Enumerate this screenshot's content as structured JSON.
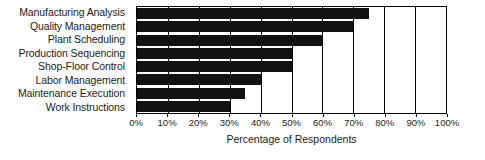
{
  "chart_data": {
    "type": "bar",
    "orientation": "horizontal",
    "title": "",
    "xlabel": "Percentage of Respondents",
    "ylabel": "",
    "categories": [
      "Manufacturing Analysis",
      "Quality Management",
      "Plant Scheduling",
      "Production Sequencing",
      "Shop-Floor Control",
      "Labor Management",
      "Maintenance Execution",
      "Work Instructions"
    ],
    "values": [
      75,
      70,
      60,
      50,
      50,
      40,
      35,
      30
    ],
    "xlim": [
      0,
      100
    ],
    "tick_values": [
      0,
      10,
      20,
      30,
      40,
      50,
      60,
      70,
      80,
      90,
      100
    ],
    "tick_labels": [
      "0%",
      "10%",
      "20%",
      "30%",
      "40%",
      "50%",
      "60%",
      "70%",
      "80%",
      "90%",
      "100%"
    ],
    "grid": true,
    "grid_axis": "x",
    "legend": false,
    "bar_color": "#121212",
    "axis_color": "#000000",
    "background_color": "#ffffff"
  }
}
